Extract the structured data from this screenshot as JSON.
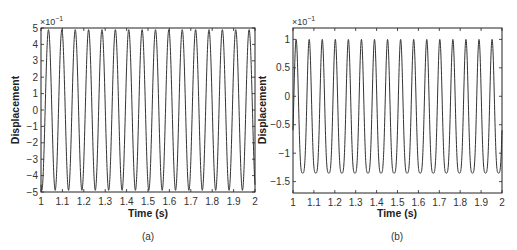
{
  "chart_data": [
    {
      "type": "line",
      "panel": "(a)",
      "title": "",
      "xlabel": "Time (s)",
      "ylabel": "Displacement",
      "y_multiplier": "×10",
      "y_multiplier_exp": "−1",
      "xlim": [
        1,
        2
      ],
      "ylim": [
        -5,
        5
      ],
      "xticks": [
        1,
        1.1,
        1.2,
        1.3,
        1.4,
        1.5,
        1.6,
        1.7,
        1.8,
        1.9,
        2
      ],
      "xtick_labels": [
        "1",
        "1.1",
        "1.2",
        "1.3",
        "1.4",
        "1.5",
        "1.6",
        "1.7",
        "1.8",
        "1.9",
        "2"
      ],
      "yticks": [
        -5,
        -4,
        -3,
        -2,
        -1,
        0,
        1,
        2,
        3,
        4,
        5
      ],
      "ytick_labels": [
        "−5",
        "−4",
        "−3",
        "−2",
        "−1",
        "0",
        "1",
        "2",
        "3",
        "4",
        "5"
      ],
      "grid": false,
      "series": [
        {
          "name": "displacement",
          "waveform": "sinusoid",
          "frequency_hz": 16,
          "amplitude": 4.9,
          "offset": 0,
          "first_peak_time": 1.035,
          "color": "#333333"
        }
      ]
    },
    {
      "type": "line",
      "panel": "(b)",
      "title": "",
      "xlabel": "Time (s)",
      "ylabel": "Displacement",
      "y_multiplier": "×10",
      "y_multiplier_exp": "−1",
      "xlim": [
        1,
        2
      ],
      "ylim": [
        -1.7,
        1.2
      ],
      "xticks": [
        1,
        1.1,
        1.2,
        1.3,
        1.4,
        1.5,
        1.6,
        1.7,
        1.8,
        1.9,
        2
      ],
      "xtick_labels": [
        "1",
        "1.1",
        "1.2",
        "1.3",
        "1.4",
        "1.5",
        "1.6",
        "1.7",
        "1.8",
        "1.9",
        "2"
      ],
      "yticks": [
        -1.5,
        -1,
        -0.5,
        0,
        0.5,
        1
      ],
      "ytick_labels": [
        "−1.5",
        "−1",
        "−0.5",
        "0",
        "0.5",
        "1"
      ],
      "grid": false,
      "series": [
        {
          "name": "displacement",
          "waveform": "asymmetric (sharp peaks, rounded troughs)",
          "frequency_hz": 16,
          "max": 1.0,
          "min": -1.35,
          "first_peak_time": 1.015,
          "color": "#333333"
        }
      ]
    }
  ],
  "panels": {
    "a": {
      "caption": "(a)"
    },
    "b": {
      "caption": "(b)"
    }
  }
}
